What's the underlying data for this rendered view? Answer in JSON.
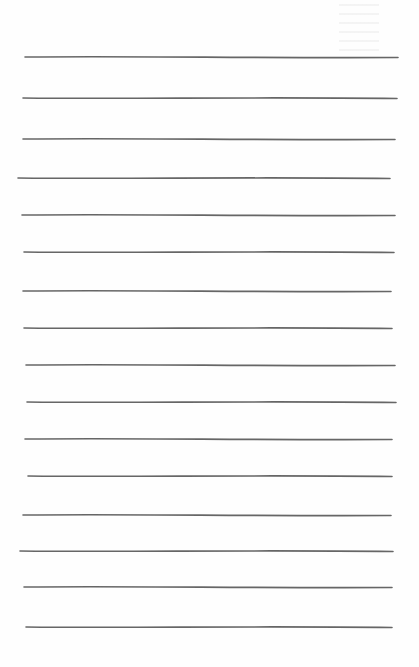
{
  "document": {
    "type": "ruled-page",
    "line_color": "#555555",
    "background": "#fefefe",
    "ruled_lines": [
      {
        "y": 57,
        "x1": 25,
        "x2": 398
      },
      {
        "y": 98,
        "x1": 23,
        "x2": 397
      },
      {
        "y": 139,
        "x1": 23,
        "x2": 395
      },
      {
        "y": 178,
        "x1": 18,
        "x2": 390
      },
      {
        "y": 215,
        "x1": 22,
        "x2": 395
      },
      {
        "y": 252,
        "x1": 24,
        "x2": 394
      },
      {
        "y": 291,
        "x1": 23,
        "x2": 391
      },
      {
        "y": 328,
        "x1": 24,
        "x2": 392
      },
      {
        "y": 365,
        "x1": 26,
        "x2": 395
      },
      {
        "y": 402,
        "x1": 27,
        "x2": 396
      },
      {
        "y": 439,
        "x1": 25,
        "x2": 392
      },
      {
        "y": 476,
        "x1": 28,
        "x2": 392
      },
      {
        "y": 515,
        "x1": 23,
        "x2": 391
      },
      {
        "y": 551,
        "x1": 20,
        "x2": 393
      },
      {
        "y": 587,
        "x1": 24,
        "x2": 392
      },
      {
        "y": 627,
        "x1": 26,
        "x2": 392
      }
    ]
  }
}
